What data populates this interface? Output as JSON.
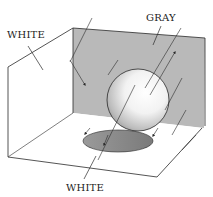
{
  "labels": {
    "left_wall": "WHITE",
    "back_wall": "GRAY",
    "floor": "WHITE"
  },
  "colors": {
    "background": "#ffffff",
    "gray_wall": "#b9b9b9",
    "line": "#2a2a2a",
    "shadow": "#8a8a8a",
    "sphere_light": "#ffffff",
    "sphere_dark": "#9a9a9a"
  }
}
